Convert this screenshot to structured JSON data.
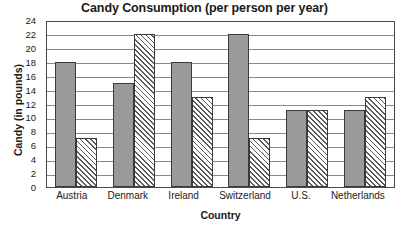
{
  "chart_data": {
    "type": "bar",
    "title": "Candy Consumption (per person per year)",
    "xlabel": "Country",
    "ylabel": "Candy (in pounds)",
    "categories": [
      "Austria",
      "Denmark",
      "Ireland",
      "Switzerland",
      "U.S.",
      "Netherlands"
    ],
    "series": [
      {
        "name": "series-solid",
        "values": [
          18,
          15,
          18,
          22,
          11,
          11
        ]
      },
      {
        "name": "series-hatched",
        "values": [
          7,
          22,
          13,
          7,
          11,
          13
        ]
      }
    ],
    "ylim": [
      0,
      24
    ],
    "ytick_step": 2,
    "yticks": [
      0,
      2,
      4,
      6,
      8,
      10,
      12,
      14,
      16,
      18,
      20,
      22,
      24
    ],
    "grid": true,
    "legend": "none",
    "colors": {
      "solid_bar": "#9a9a9a",
      "hatched_bar": "#ffffff",
      "bar_border": "#3a3a3a",
      "gridline": "#8a8a8a",
      "frame": "#4a4a4a",
      "text": "#1a1a1a",
      "background": "#ffffff"
    }
  }
}
